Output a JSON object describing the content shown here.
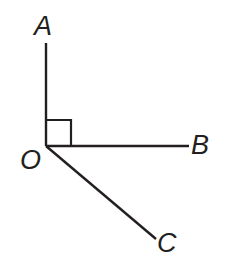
{
  "figure": {
    "background_color": "#ffffff",
    "stroke_color": "#231f20",
    "vertex": {
      "name": "O",
      "x": 46,
      "y": 146
    },
    "labels": {
      "a": "A",
      "b": "B",
      "c": "C",
      "o": "O"
    },
    "rays": [
      {
        "name": "OA",
        "from": "O",
        "to": "A",
        "x1": 46,
        "y1": 146,
        "x2": 46,
        "y2": 43,
        "direction": "up"
      },
      {
        "name": "OB",
        "from": "O",
        "to": "B",
        "x1": 46,
        "y1": 146,
        "x2": 189,
        "y2": 146,
        "direction": "right"
      },
      {
        "name": "OC",
        "from": "O",
        "to": "C",
        "x1": 46,
        "y1": 146,
        "x2": 156,
        "y2": 239,
        "direction": "down-right"
      }
    ],
    "right_angle_mark": {
      "name": "right-angle-AOB",
      "between": "OA and OB",
      "size": 26,
      "points": "46,120 71,120 71,146"
    }
  }
}
